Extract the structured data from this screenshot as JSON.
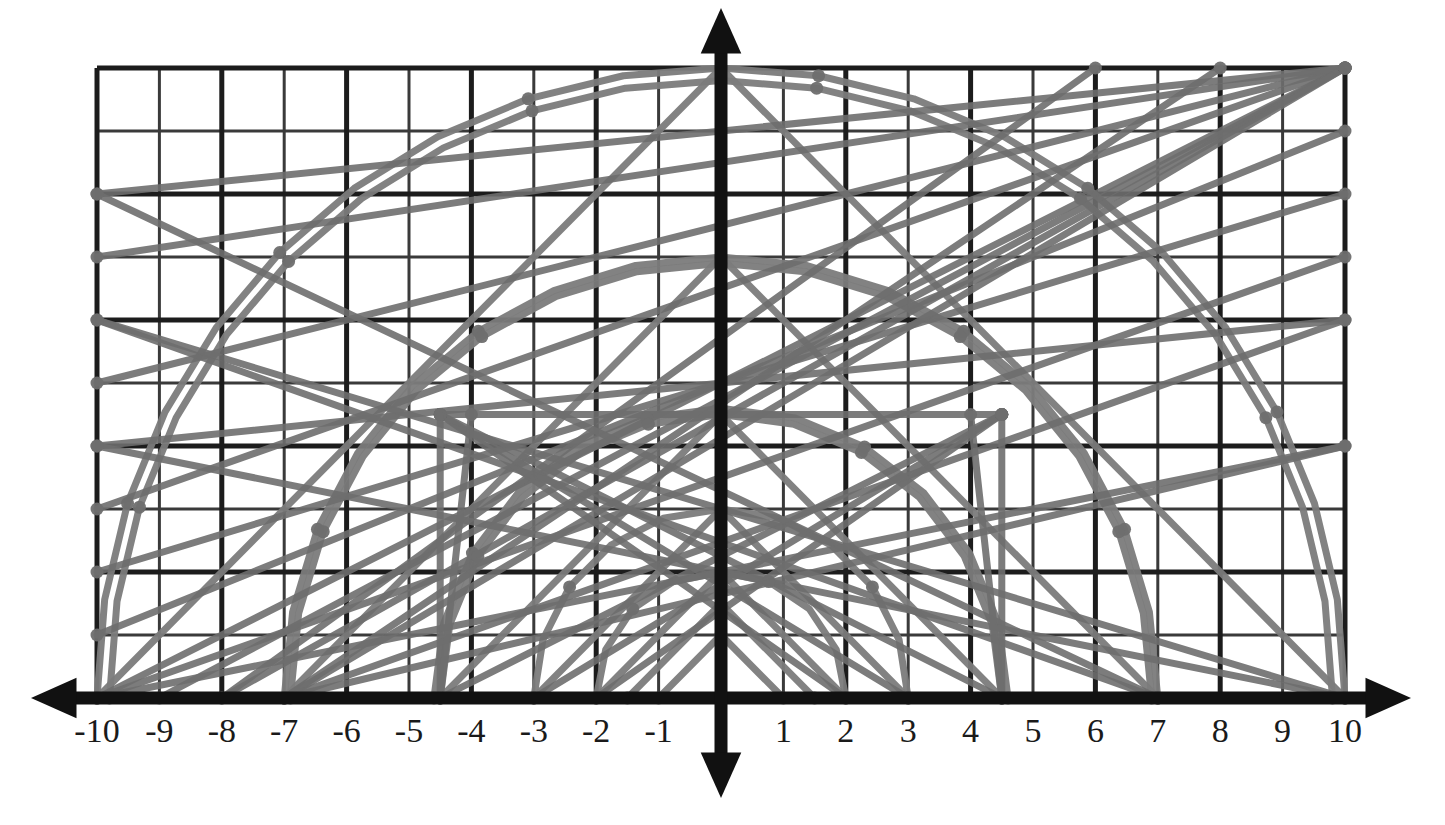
{
  "figure": {
    "title": "",
    "background_color": "#ffffff"
  },
  "colors": {
    "grid_line": "#3a3a3a",
    "grid_line_major": "#1c1c1c",
    "axis": "#111111",
    "curve": "#7b7b7b",
    "curve_dark": "#6e6e6e",
    "label": "#1a1a1a",
    "point_marker": "#6e6e6e"
  },
  "chart_data": {
    "type": "line",
    "title": "",
    "xlabel": "",
    "ylabel": "",
    "xlim": [
      -10,
      10
    ],
    "ylim": [
      0,
      10
    ],
    "grid": true,
    "legend": "none",
    "x_tick_labels": [
      "-10",
      "-9",
      "-8",
      "-7",
      "-6",
      "-5",
      "-4",
      "-3",
      "-2",
      "-1",
      "0",
      "1",
      "2",
      "3",
      "4",
      "5",
      "6",
      "7",
      "8",
      "9",
      "10"
    ],
    "x_ticks": [
      -10,
      -9,
      -8,
      -7,
      -6,
      -5,
      -4,
      -3,
      -2,
      -1,
      0,
      1,
      2,
      3,
      4,
      5,
      6,
      7,
      8,
      9,
      10
    ],
    "y_ticks": [
      0,
      1,
      2,
      3,
      4,
      5,
      6,
      7,
      8,
      9,
      10
    ],
    "y_tick_labels": [],
    "axes": {
      "x_axis_arrows": [
        "left",
        "right"
      ],
      "y_axis_arrows": [
        "up",
        "down"
      ],
      "x_axis_at_y": 0,
      "y_axis_at_x": 0
    },
    "series": [
      {
        "name": "arc-r10",
        "kind": "semicircle",
        "center": [
          0,
          0
        ],
        "radius": 10.0,
        "samples": 21
      },
      {
        "name": "arc-r9.8",
        "kind": "semicircle",
        "center": [
          0,
          0
        ],
        "radius": 9.8,
        "samples": 21
      },
      {
        "name": "arc-r7",
        "kind": "semicircle",
        "center": [
          0,
          0
        ],
        "radius": 7.0,
        "samples": 17
      },
      {
        "name": "arc-r6.9",
        "kind": "semicircle",
        "center": [
          0,
          0
        ],
        "radius": 6.9,
        "samples": 17
      },
      {
        "name": "arc-r4.6",
        "kind": "semicircle",
        "center": [
          0,
          0
        ],
        "radius": 4.6,
        "samples": 13
      },
      {
        "name": "arc-r4.5",
        "kind": "semicircle",
        "center": [
          0,
          0
        ],
        "radius": 4.5,
        "samples": 13
      },
      {
        "name": "arc-r3",
        "kind": "semicircle",
        "center": [
          0,
          0
        ],
        "radius": 3.0,
        "samples": 11
      },
      {
        "name": "arc-r2",
        "kind": "semicircle",
        "center": [
          0,
          0
        ],
        "radius": 2.0,
        "samples": 9
      },
      {
        "name": "tent-h10",
        "kind": "tent",
        "apex": [
          0,
          10
        ],
        "half_width": 10.0
      },
      {
        "name": "tent-h7",
        "kind": "tent",
        "apex": [
          0,
          7
        ],
        "half_width": 7.0
      },
      {
        "name": "tent-h4.5",
        "kind": "tent",
        "apex": [
          0,
          4.5
        ],
        "half_width": 4.5
      },
      {
        "name": "tent-h3",
        "kind": "tent",
        "apex": [
          0,
          3
        ],
        "half_width": 3.0
      },
      {
        "name": "tent-h2",
        "kind": "tent",
        "apex": [
          0,
          2
        ],
        "half_width": 2.0
      },
      {
        "name": "tent-h1.5",
        "kind": "tent",
        "apex": [
          0,
          1.5
        ],
        "half_width": 1.5
      },
      {
        "name": "tent-h1",
        "kind": "tent",
        "apex": [
          0,
          1
        ],
        "half_width": 1.0
      }
    ],
    "chords": [
      {
        "name": "chord-a",
        "from": [
          -10,
          0
        ],
        "to": [
          10,
          10
        ]
      },
      {
        "name": "chord-b",
        "from": [
          -10,
          1
        ],
        "to": [
          10,
          9
        ]
      },
      {
        "name": "chord-c",
        "from": [
          -10,
          3
        ],
        "to": [
          10,
          10
        ]
      },
      {
        "name": "chord-d",
        "from": [
          -10,
          5
        ],
        "to": [
          10,
          10
        ]
      },
      {
        "name": "chord-e",
        "from": [
          -10,
          7
        ],
        "to": [
          10,
          10
        ]
      },
      {
        "name": "chord-f",
        "from": [
          -10,
          8
        ],
        "to": [
          10,
          10
        ]
      },
      {
        "name": "chord-g",
        "from": [
          -10,
          0
        ],
        "to": [
          10,
          7
        ]
      },
      {
        "name": "chord-h",
        "from": [
          -10,
          2
        ],
        "to": [
          10,
          8
        ]
      },
      {
        "name": "chord-i",
        "from": [
          -10,
          4
        ],
        "to": [
          10,
          6
        ]
      },
      {
        "name": "chord-j",
        "from": [
          -9,
          0
        ],
        "to": [
          10,
          10
        ]
      },
      {
        "name": "chord-k",
        "from": [
          -8,
          0
        ],
        "to": [
          10,
          10
        ]
      },
      {
        "name": "chord-l",
        "from": [
          -7,
          0
        ],
        "to": [
          10,
          10
        ]
      },
      {
        "name": "chord-m",
        "from": [
          -7,
          0
        ],
        "to": [
          8,
          10
        ]
      },
      {
        "name": "chord-n",
        "from": [
          -8,
          0
        ],
        "to": [
          6,
          10
        ]
      },
      {
        "name": "chord-o",
        "from": [
          -4.5,
          0
        ],
        "to": [
          4.5,
          4.5
        ]
      },
      {
        "name": "chord-p",
        "from": [
          -4.5,
          4.5
        ],
        "to": [
          4.5,
          0
        ]
      },
      {
        "name": "chord-q",
        "from": [
          -3,
          0
        ],
        "to": [
          4.5,
          4.5
        ]
      },
      {
        "name": "chord-r",
        "from": [
          -2,
          0
        ],
        "to": [
          4.5,
          4.5
        ]
      },
      {
        "name": "chord-s",
        "from": [
          2,
          0
        ],
        "to": [
          -4.5,
          4.5
        ]
      },
      {
        "name": "chord-t",
        "from": [
          3,
          0
        ],
        "to": [
          -4.5,
          4.5
        ]
      },
      {
        "name": "chord-u",
        "from": [
          -4.5,
          4.5
        ],
        "to": [
          4.5,
          4.5
        ]
      },
      {
        "name": "chord-v",
        "from": [
          -4.5,
          0
        ],
        "to": [
          -4.5,
          4.5
        ]
      },
      {
        "name": "chord-w",
        "from": [
          4.5,
          0
        ],
        "to": [
          4.5,
          4.5
        ]
      },
      {
        "name": "chord-x",
        "from": [
          7,
          0
        ],
        "to": [
          -10,
          8
        ]
      },
      {
        "name": "chord-y",
        "from": [
          7,
          0
        ],
        "to": [
          -10,
          6
        ]
      },
      {
        "name": "chord-z",
        "from": [
          10,
          0
        ],
        "to": [
          -10,
          6
        ]
      },
      {
        "name": "chord-aa",
        "from": [
          10,
          0
        ],
        "to": [
          -10,
          4
        ]
      },
      {
        "name": "chord-ab",
        "from": [
          -7,
          0
        ],
        "to": [
          10,
          6
        ]
      },
      {
        "name": "chord-ac",
        "from": [
          -7,
          0
        ],
        "to": [
          10,
          4
        ]
      },
      {
        "name": "chord-ad",
        "from": [
          -10,
          0
        ],
        "to": [
          10,
          4
        ]
      },
      {
        "name": "chord-ae",
        "from": [
          4,
          4.5
        ],
        "to": [
          4.5,
          0
        ]
      },
      {
        "name": "chord-af",
        "from": [
          -4,
          4.5
        ],
        "to": [
          -4.5,
          0
        ]
      }
    ]
  }
}
